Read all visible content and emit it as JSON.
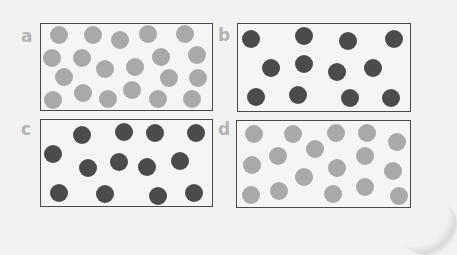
{
  "figure": {
    "colors": {
      "background": "#f2f2f0",
      "box_border": "#4a4a4a",
      "label": "#b4b4b4",
      "light_particle": "#a9a9a9",
      "dark_particle": "#4b4b4b"
    },
    "particle_radius": 9,
    "panels": [
      {
        "label": "a",
        "label_pos": [
          24,
          40
        ],
        "box": [
          40,
          23,
          173,
          88
        ],
        "particle_color": "#a9a9a9",
        "count": 20,
        "particles": [
          [
            59,
            35
          ],
          [
            93,
            35
          ],
          [
            120,
            40
          ],
          [
            148,
            34
          ],
          [
            185,
            34
          ],
          [
            52,
            58
          ],
          [
            82,
            58
          ],
          [
            161,
            57
          ],
          [
            197,
            55
          ],
          [
            105,
            69
          ],
          [
            135,
            67
          ],
          [
            64,
            77
          ],
          [
            169,
            78
          ],
          [
            198,
            78
          ],
          [
            53,
            100
          ],
          [
            83,
            93
          ],
          [
            108,
            99
          ],
          [
            132,
            90
          ],
          [
            158,
            99
          ],
          [
            192,
            99
          ]
        ]
      },
      {
        "label": "b",
        "label_pos": [
          222,
          40
        ],
        "box": [
          237,
          23,
          174,
          89
        ],
        "particle_color": "#4b4b4b",
        "count": 12,
        "particles": [
          [
            251,
            39
          ],
          [
            304,
            36
          ],
          [
            348,
            41
          ],
          [
            394,
            39
          ],
          [
            271,
            68
          ],
          [
            304,
            64
          ],
          [
            337,
            72
          ],
          [
            373,
            68
          ],
          [
            256,
            97
          ],
          [
            298,
            95
          ],
          [
            350,
            98
          ],
          [
            391,
            98
          ]
        ]
      },
      {
        "label": "c",
        "label_pos": [
          24,
          131
        ],
        "box": [
          40,
          119,
          173,
          88
        ],
        "particle_color": "#4b4b4b",
        "count": 13,
        "particles": [
          [
            82,
            135
          ],
          [
            124,
            132
          ],
          [
            155,
            133
          ],
          [
            196,
            133
          ],
          [
            53,
            154
          ],
          [
            88,
            168
          ],
          [
            119,
            162
          ],
          [
            147,
            167
          ],
          [
            180,
            161
          ],
          [
            59,
            193
          ],
          [
            105,
            194
          ],
          [
            158,
            196
          ],
          [
            194,
            193
          ]
        ]
      },
      {
        "label": "d",
        "label_pos": [
          221,
          131
        ],
        "box": [
          236,
          120,
          175,
          88
        ],
        "particle_color": "#a9a9a9",
        "count": 17,
        "particles": [
          [
            254,
            134
          ],
          [
            293,
            134
          ],
          [
            336,
            133
          ],
          [
            367,
            133
          ],
          [
            397,
            142
          ],
          [
            315,
            149
          ],
          [
            278,
            156
          ],
          [
            365,
            156
          ],
          [
            252,
            165
          ],
          [
            337,
            168
          ],
          [
            393,
            171
          ],
          [
            304,
            177
          ],
          [
            251,
            195
          ],
          [
            279,
            191
          ],
          [
            333,
            194
          ],
          [
            365,
            187
          ],
          [
            399,
            196
          ]
        ]
      }
    ]
  }
}
